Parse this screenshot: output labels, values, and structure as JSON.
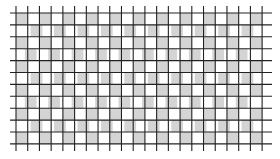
{
  "figure": {
    "type": "illusion-grid",
    "colors": {
      "background": "#ffffff",
      "cell": "#d4d4d4",
      "line": "#222222"
    },
    "grid": {
      "x_start": 16,
      "x_step": 11.72,
      "v_lines": 22,
      "y_start": 13,
      "y_step": 11.9,
      "h_lines": 12,
      "h_line_x0": 10,
      "h_line_x1": 272,
      "v_line_y0": 6,
      "v_line_y1": 151,
      "line_width": 1.1
    },
    "rows": [
      {
        "offset": 0.0,
        "phase": 0
      },
      {
        "offset": 0.25,
        "phase": 1
      },
      {
        "offset": 0.0,
        "phase": 0
      },
      {
        "offset": -0.25,
        "phase": 1
      },
      {
        "offset": 0.0,
        "phase": 0
      },
      {
        "offset": 0.25,
        "phase": 1
      },
      {
        "offset": 0.0,
        "phase": 0
      },
      {
        "offset": -0.25,
        "phase": 1
      },
      {
        "offset": 0.0,
        "phase": 0
      },
      {
        "offset": 0.25,
        "phase": 1
      },
      {
        "offset": 0.0,
        "phase": 0
      },
      {
        "offset": -0.25,
        "phase": 1
      }
    ]
  }
}
